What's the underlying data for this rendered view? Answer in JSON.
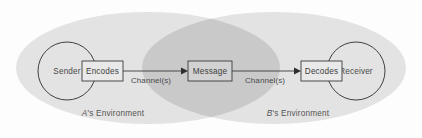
{
  "diagram": {
    "type": "venn-flow-diagram",
    "background_color": "#fdfdfd",
    "environments": [
      {
        "id": "env-a",
        "label": "A's Environment",
        "label_italic_prefix": "A",
        "label_rest": "'s Environment",
        "fill": "#e3e3e3"
      },
      {
        "id": "env-b",
        "label": "B's Environment",
        "label_italic_prefix": "B",
        "label_rest": "'s Environment",
        "fill": "#e3e3e3"
      }
    ],
    "overlap": {
      "label": "shared-overlap-region",
      "fill": "#c9c9c9"
    },
    "nodes": [
      {
        "id": "sender",
        "shape": "circle",
        "label": "Sender"
      },
      {
        "id": "encodes",
        "shape": "rectangle",
        "label": "Encodes"
      },
      {
        "id": "message",
        "shape": "rectangle",
        "label": "Message"
      },
      {
        "id": "decodes",
        "shape": "rectangle",
        "label": "Decodes"
      },
      {
        "id": "receiver",
        "shape": "circle",
        "label": "Receiver"
      }
    ],
    "connectors": [
      {
        "id": "channel-left",
        "from": "encodes",
        "to": "message",
        "label": "Channel(s)",
        "direction": "right"
      },
      {
        "id": "channel-right",
        "from": "message",
        "to": "decodes",
        "label": "Channel(s)",
        "direction": "right"
      }
    ],
    "colors": {
      "environment_fill": "#e3e3e3",
      "overlap_fill": "#c9c9c9",
      "box_fill": "#e9e9e9",
      "box_fill_center": "#d2d2d2",
      "stroke": "#2e2e2e",
      "text": "#4a4a4a"
    }
  }
}
